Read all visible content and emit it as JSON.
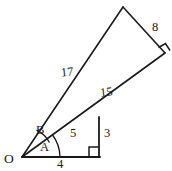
{
  "figure": {
    "type": "geometry-diagram",
    "stroke_color": "#1a1a1a",
    "background_color": "#ffffff"
  },
  "vertices": {
    "origin": {
      "label": "O",
      "x": 22,
      "y": 157
    },
    "base_right": {
      "label": "",
      "x": 99,
      "y": 157
    },
    "inner_top": {
      "label": "",
      "x": 99,
      "y": 117
    },
    "apex": {
      "label": "",
      "x": 123,
      "y": 7
    },
    "outer_right": {
      "label": "",
      "x": 165,
      "y": 53
    }
  },
  "side_labels": {
    "seventeen": "17",
    "eight": "8",
    "fifteen": "15",
    "five": "5",
    "three": "3",
    "four": "4"
  },
  "angle_labels": {
    "a": "A",
    "b": "B"
  },
  "markers": {
    "right_angle_base": "right-angle",
    "right_angle_outer": "right-angle"
  }
}
